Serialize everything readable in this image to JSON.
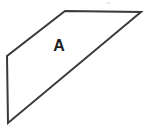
{
  "figure": {
    "background_color": "#ffffff",
    "stroke_color": "#3a3a3a",
    "stroke_width": 2,
    "width": 144,
    "height": 134,
    "label_color": "#1d1d1d",
    "shape": {
      "name": "quadrilateral-A",
      "type": "trapezoid",
      "label": "A",
      "label_position": {
        "x": 59,
        "y": 47
      },
      "closed": true,
      "vertices": [
        {
          "name": "top-left",
          "x": 65,
          "y": 11
        },
        {
          "name": "top-right",
          "x": 141,
          "y": 12
        },
        {
          "name": "bottom-left",
          "x": 8,
          "y": 123
        },
        {
          "name": "left",
          "x": 7,
          "y": 56
        }
      ],
      "points_attr": "65,11 141,12 8,123 7,56",
      "edges": [
        {
          "name": "top-edge",
          "from": "top-left",
          "to": "top-right"
        },
        {
          "name": "diagonal-edge",
          "from": "top-right",
          "to": "bottom-left"
        },
        {
          "name": "bottom-left-edge",
          "from": "bottom-left",
          "to": "left"
        },
        {
          "name": "upper-left-edge",
          "from": "left",
          "to": "top-left"
        }
      ]
    },
    "artifact": {
      "x": 107,
      "y": 2,
      "color": "#e2e2e2"
    }
  }
}
